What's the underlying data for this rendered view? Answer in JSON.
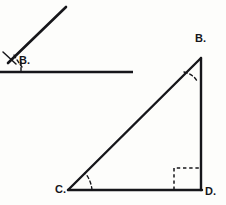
{
  "figure": {
    "background_color": "#fdfdfb",
    "stroke_color": "#16161a",
    "labels": {
      "angle_vertex": "B.",
      "triangle_apex": "B.",
      "triangle_left": "C.",
      "triangle_right": "D."
    },
    "shapes": {
      "acute_angle": {
        "name": "acute-angle-figure",
        "ray_start": [
          8,
          63
        ],
        "ray_end": [
          66,
          7
        ],
        "baseline_start": [
          0,
          72
        ],
        "baseline_end": [
          133,
          72
        ],
        "arc_marker": "dashed",
        "tick_marks": 2
      },
      "right_triangle": {
        "name": "right-triangle-bcd",
        "vertex_b": [
          201,
          58
        ],
        "vertex_c": [
          68,
          190
        ],
        "vertex_d": [
          201,
          190
        ],
        "hypotenuse": "C to B",
        "vertical_leg": "B to D",
        "horizontal_leg": "C to D",
        "angle_marker_b": "dashed arc",
        "angle_marker_c": "dashed arc",
        "angle_marker_d": "dashed right-angle square"
      }
    }
  }
}
